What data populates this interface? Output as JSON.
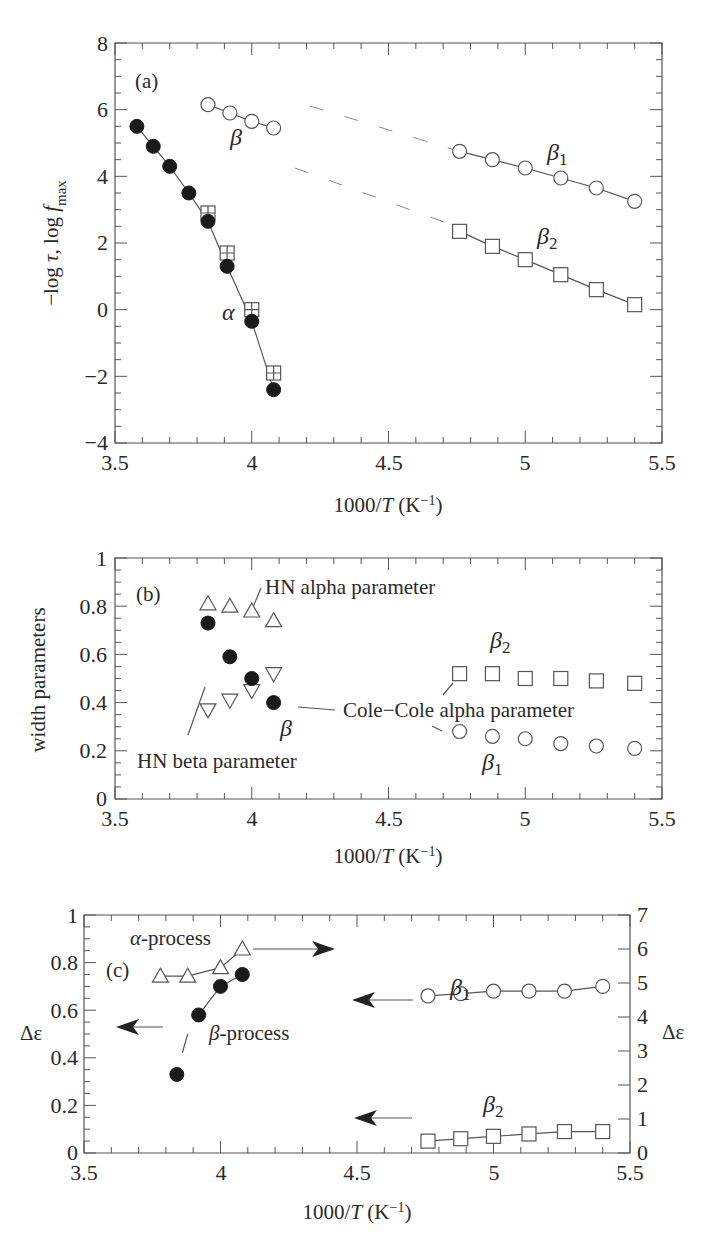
{
  "figure": {
    "panels": [
      "(a)",
      "(b)",
      "(c)"
    ]
  },
  "chart_data": [
    {
      "panel": "(a)",
      "type": "line",
      "xlabel": "1000/T (K⁻¹)",
      "ylabel": "−log τ, log f_max",
      "xlim": [
        3.5,
        5.5
      ],
      "ylim": [
        -4,
        8
      ],
      "xticks": [
        "3.5",
        "4",
        "4.5",
        "5",
        "5.5"
      ],
      "yticks": [
        "−4",
        "−2",
        "0",
        "2",
        "4",
        "6",
        "8"
      ],
      "annotations": [
        "(a)",
        "α",
        "β",
        "β1",
        "β2"
      ],
      "series": [
        {
          "name": "α (filled circles)",
          "marker": "filled-circle",
          "x": [
            3.58,
            3.64,
            3.7,
            3.77,
            3.84,
            3.91,
            4.0,
            4.08
          ],
          "y": [
            5.5,
            4.9,
            4.3,
            3.5,
            2.65,
            1.3,
            -0.35,
            -2.4
          ]
        },
        {
          "name": "α (crossed squares)",
          "marker": "crossed-square",
          "x": [
            3.84,
            3.91,
            4.0,
            4.08
          ],
          "y": [
            2.9,
            1.7,
            0.0,
            -1.9
          ]
        },
        {
          "name": "β",
          "marker": "open-circle",
          "x": [
            3.84,
            3.92,
            4.0,
            4.08
          ],
          "y": [
            6.15,
            5.9,
            5.65,
            5.45
          ]
        },
        {
          "name": "β1",
          "marker": "open-circle",
          "x": [
            4.76,
            4.88,
            5.0,
            5.13,
            5.26,
            5.4
          ],
          "y": [
            4.75,
            4.5,
            4.25,
            3.95,
            3.65,
            3.25
          ]
        },
        {
          "name": "β2",
          "marker": "open-square",
          "x": [
            4.76,
            4.88,
            5.0,
            5.13,
            5.26,
            5.4
          ],
          "y": [
            2.35,
            1.9,
            1.5,
            1.05,
            0.6,
            0.15
          ]
        }
      ]
    },
    {
      "panel": "(b)",
      "type": "scatter",
      "xlabel": "1000/T (K⁻¹)",
      "ylabel": "width parameters",
      "xlim": [
        3.5,
        5.5
      ],
      "ylim": [
        0,
        1
      ],
      "xticks": [
        "3.5",
        "4",
        "4.5",
        "5",
        "5.5"
      ],
      "yticks": [
        "0",
        "0.2",
        "0.4",
        "0.6",
        "0.8",
        "1"
      ],
      "annotations": [
        "(b)",
        "HN alpha parameter",
        "HN beta parameter",
        "Cole−Cole alpha parameter",
        "β",
        "β1",
        "β2"
      ],
      "series": [
        {
          "name": "HN alpha parameter",
          "marker": "open-triangle-up",
          "x": [
            3.84,
            3.92,
            4.0,
            4.08
          ],
          "y": [
            0.81,
            0.8,
            0.78,
            0.74
          ]
        },
        {
          "name": "HN beta parameter",
          "marker": "open-triangle-down",
          "x": [
            3.84,
            3.92,
            4.0,
            4.08
          ],
          "y": [
            0.37,
            0.41,
            0.45,
            0.52
          ]
        },
        {
          "name": "β Cole−Cole alpha parameter",
          "marker": "filled-circle",
          "x": [
            3.84,
            3.92,
            4.0,
            4.08
          ],
          "y": [
            0.73,
            0.59,
            0.5,
            0.4
          ]
        },
        {
          "name": "β2",
          "marker": "open-square",
          "x": [
            4.76,
            4.88,
            5.0,
            5.13,
            5.26,
            5.4
          ],
          "y": [
            0.52,
            0.52,
            0.5,
            0.5,
            0.49,
            0.48
          ]
        },
        {
          "name": "β1",
          "marker": "open-circle",
          "x": [
            4.76,
            4.88,
            5.0,
            5.13,
            5.26,
            5.4
          ],
          "y": [
            0.28,
            0.26,
            0.25,
            0.23,
            0.22,
            0.21
          ]
        }
      ]
    },
    {
      "panel": "(c)",
      "type": "line",
      "xlabel": "1000/T (K⁻¹)",
      "ylabel": "Δε",
      "ylabel_right": "Δε",
      "xlim": [
        3.5,
        5.5
      ],
      "ylim": [
        0,
        1
      ],
      "ylim_right": [
        0,
        7
      ],
      "xticks": [
        "3.5",
        "4",
        "4.5",
        "5",
        "5.5"
      ],
      "yticks": [
        "0",
        "0.2",
        "0.4",
        "0.6",
        "0.8",
        "1"
      ],
      "yticks_right": [
        "0",
        "1",
        "2",
        "3",
        "4",
        "5",
        "6",
        "7"
      ],
      "annotations": [
        "(c)",
        "α-process",
        "β-process",
        "β1",
        "β2"
      ],
      "series": [
        {
          "name": "α-process (right axis)",
          "marker": "open-triangle-up",
          "axis": "right",
          "x": [
            3.78,
            3.88,
            4.0,
            4.08
          ],
          "y": [
            5.2,
            5.2,
            5.45,
            6.0
          ]
        },
        {
          "name": "β-process (left axis)",
          "marker": "filled-circle",
          "axis": "left",
          "x": [
            3.84,
            3.92,
            4.0,
            4.08
          ],
          "y": [
            0.33,
            0.58,
            0.7,
            0.75
          ]
        },
        {
          "name": "β1 (left axis)",
          "marker": "open-circle",
          "axis": "left",
          "x": [
            4.76,
            4.88,
            5.0,
            5.13,
            5.26,
            5.4
          ],
          "y": [
            0.66,
            0.67,
            0.68,
            0.68,
            0.68,
            0.7
          ]
        },
        {
          "name": "β2 (left axis)",
          "marker": "open-square",
          "axis": "left",
          "x": [
            4.76,
            4.88,
            5.0,
            5.13,
            5.26,
            5.4
          ],
          "y": [
            0.05,
            0.06,
            0.07,
            0.08,
            0.09,
            0.09
          ]
        }
      ]
    }
  ],
  "labels": {
    "a": {
      "tag": "(a)",
      "xlabel": "1000/T (K",
      "xsup": "−1",
      "xclose": ")",
      "ylabel": "−log τ, log f",
      "ysub": "max",
      "alpha": "α",
      "beta": "β",
      "beta1": "β",
      "beta1_sub": "1",
      "beta2": "β",
      "beta2_sub": "2",
      "xticks": [
        "3.5",
        "4",
        "4.5",
        "5",
        "5.5"
      ],
      "yticks": [
        "−4",
        "−2",
        "0",
        "2",
        "4",
        "6",
        "8"
      ]
    },
    "b": {
      "tag": "(b)",
      "xlabel": "1000/T (K",
      "xsup": "−1",
      "xclose": ")",
      "ylabel": "width parameters",
      "hn_alpha": "HN alpha parameter",
      "hn_beta": "HN beta parameter",
      "cole": "Cole−Cole alpha parameter",
      "beta": "β",
      "beta1": "β",
      "beta1_sub": "1",
      "beta2": "β",
      "beta2_sub": "2",
      "xticks": [
        "3.5",
        "4",
        "4.5",
        "5",
        "5.5"
      ],
      "yticks": [
        "0",
        "0.2",
        "0.4",
        "0.6",
        "0.8",
        "1"
      ]
    },
    "c": {
      "tag": "(c)",
      "xlabel": "1000/T (K",
      "xsup": "−1",
      "xclose": ")",
      "ylabel": "Δε",
      "ylabel_right": "Δε",
      "alpha_proc": "α",
      "alpha_proc_rest": "-process",
      "beta_proc": "β",
      "beta_proc_rest": "-process",
      "beta1": "β",
      "beta1_sub": "1",
      "beta2": "β",
      "beta2_sub": "2",
      "xticks": [
        "3.5",
        "4",
        "4.5",
        "5",
        "5.5"
      ],
      "yticks": [
        "0",
        "0.2",
        "0.4",
        "0.6",
        "0.8",
        "1"
      ],
      "yticks_right": [
        "0",
        "1",
        "2",
        "3",
        "4",
        "5",
        "6",
        "7"
      ]
    }
  }
}
